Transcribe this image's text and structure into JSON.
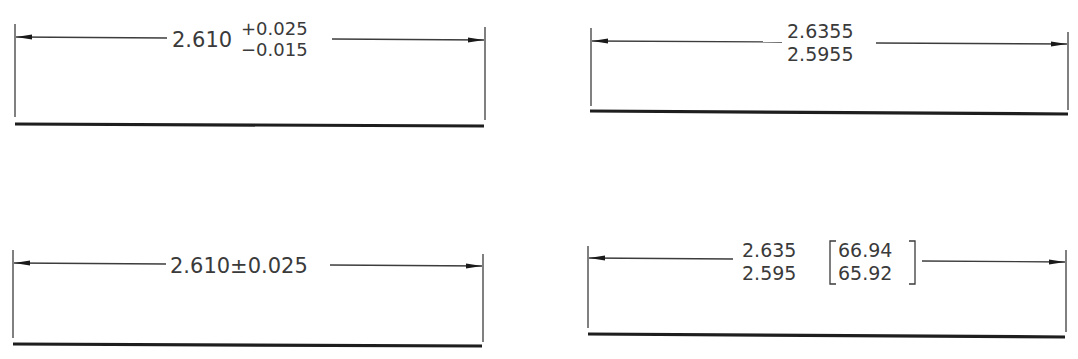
{
  "figure": {
    "colors": {
      "ink": "#3a3a3a",
      "background": "#ffffff"
    }
  },
  "panels": [
    {
      "id": "unequal-bilateral-tolerance",
      "nominal": "2.610",
      "upper": "+0.025",
      "lower": "−0.015"
    },
    {
      "id": "limit-dimension",
      "upper": "2.6355",
      "lower": "2.5955"
    },
    {
      "id": "equal-bilateral-tolerance",
      "text": "2.610±0.025"
    },
    {
      "id": "dual-dimension-limits",
      "upper": "2.635",
      "lower": "2.595",
      "upper_metric": "66.94",
      "lower_metric": "65.92",
      "bracket_open": "[",
      "bracket_close": "]"
    }
  ]
}
